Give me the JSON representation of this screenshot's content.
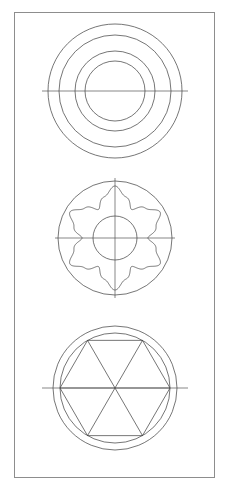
{
  "sheet": {
    "width": 229,
    "height": 492,
    "background_color": "#ffffff",
    "title": "Technical Drawing Sheet",
    "description": "Engineering line drawing sheet with three circular plan views stacked vertically inside a rectangular border frame."
  },
  "frame": {
    "name": "border-frame",
    "x": 14.5,
    "y": 12.5,
    "width": 200,
    "height": 465,
    "stroke_color": "#8d8d8d",
    "stroke_width": 1,
    "fill": "none"
  },
  "style": {
    "line_color": "#3b3b3b",
    "centerline_color": "#555555",
    "line_width": 0.7,
    "centerline_width": 0.7
  },
  "figures": [
    {
      "id": "figure-1",
      "name": "concentric-circles-view",
      "label": "Top view - four concentric circles",
      "center_x": 115,
      "center_y": 91,
      "circles": [
        {
          "name": "outer-circle",
          "radius": 67
        },
        {
          "name": "second-circle",
          "radius": 56
        },
        {
          "name": "third-circle",
          "radius": 40
        },
        {
          "name": "inner-circle",
          "radius": 30
        }
      ],
      "centerlines": {
        "horizontal": {
          "present": true,
          "half_length": 73
        },
        "vertical": {
          "present": false,
          "half_length": 0
        }
      }
    },
    {
      "id": "figure-2",
      "name": "lobed-cam-view",
      "label": "Middle view - six lobed flower profile within circle",
      "center_x": 115,
      "center_y": 238,
      "circles": [
        {
          "name": "outer-circle",
          "radius": 57
        },
        {
          "name": "inner-bore-circle",
          "radius": 22
        }
      ],
      "lobe_profile": {
        "name": "six-lobe-profile",
        "lobe_count": 6,
        "outer_radius": 52,
        "inner_radius": 33,
        "phase_degrees": 90
      },
      "centerlines": {
        "horizontal": {
          "present": true,
          "half_length": 60
        },
        "vertical": {
          "present": true,
          "half_length": 60
        }
      }
    },
    {
      "id": "figure-3",
      "name": "hexagon-spoke-view",
      "label": "Bottom view - inscribed hexagon with six radial spokes",
      "center_x": 115,
      "center_y": 388,
      "circles": [
        {
          "name": "outer-circle",
          "radius": 62
        },
        {
          "name": "inner-circle",
          "radius": 55
        }
      ],
      "polygon": {
        "name": "inscribed-hexagon",
        "sides": 6,
        "circumradius": 55,
        "phase_degrees": 0
      },
      "spokes": {
        "name": "radial-spokes",
        "count": 6,
        "length": 55,
        "phase_degrees": 0
      },
      "centerlines": {
        "horizontal": {
          "present": true,
          "half_length": 73
        },
        "vertical": {
          "present": false,
          "half_length": 0
        }
      }
    }
  ]
}
